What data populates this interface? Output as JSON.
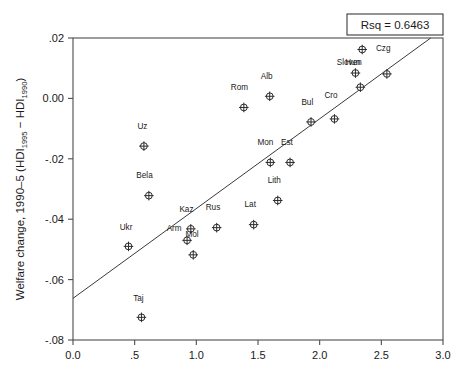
{
  "chart_data": {
    "type": "scatter",
    "title": "",
    "xlabel": "",
    "ylabel": "Welfare change, 1990–5 (HDI1995 − HDI1990)",
    "ylabel_parts": {
      "lead": "Welfare change, 1990–5 (HDI",
      "sub1": "1995",
      "mid": " − HDI",
      "sub2": "1990",
      "tail": ")"
    },
    "xlim": [
      0.0,
      3.0
    ],
    "ylim": [
      -0.08,
      0.02
    ],
    "grid": false,
    "legend": null,
    "xticks": [
      0.0,
      0.5,
      1.0,
      1.5,
      2.0,
      2.5,
      3.0
    ],
    "xtick_labels": [
      "0.0",
      ".5",
      "1.0",
      "1.5",
      "2.0",
      "2.5",
      "3.0"
    ],
    "yticks": [
      0.02,
      0.0,
      -0.02,
      -0.04,
      -0.06,
      -0.08
    ],
    "ytick_labels": [
      ".02",
      "0.00",
      "-.02",
      "-.04",
      "-.06",
      "-.08"
    ],
    "marker_style": "circle-with-cross",
    "points": [
      {
        "label": "Ukr",
        "x": 0.45,
        "y": -0.049,
        "lx": -0.02,
        "ly": 0.0055
      },
      {
        "label": "Taj",
        "x": 0.555,
        "y": -0.0725,
        "lx": -0.025,
        "ly": 0.0055
      },
      {
        "label": "Uz",
        "x": 0.575,
        "y": -0.0158,
        "lx": -0.012,
        "ly": 0.0057
      },
      {
        "label": "Bela",
        "x": 0.615,
        "y": -0.0322,
        "lx": -0.035,
        "ly": 0.0057
      },
      {
        "label": "Arm",
        "x": 0.925,
        "y": -0.047,
        "lx": -0.105,
        "ly": 0.003
      },
      {
        "label": "Kaz",
        "x": 0.955,
        "y": -0.0432,
        "lx": -0.035,
        "ly": 0.0057
      },
      {
        "label": "Mol",
        "x": 0.975,
        "y": -0.0518,
        "lx": -0.01,
        "ly": 0.0058
      },
      {
        "label": "Rus",
        "x": 1.165,
        "y": -0.0428,
        "lx": -0.03,
        "ly": 0.0057
      },
      {
        "label": "Rom",
        "x": 1.385,
        "y": -0.003,
        "lx": -0.035,
        "ly": 0.0057
      },
      {
        "label": "Lat",
        "x": 1.465,
        "y": -0.0418,
        "lx": -0.028,
        "ly": 0.0057
      },
      {
        "label": "Alb",
        "x": 1.595,
        "y": 0.0007,
        "lx": -0.025,
        "ly": 0.0057
      },
      {
        "label": "Mon",
        "x": 1.6,
        "y": -0.0212,
        "lx": -0.04,
        "ly": 0.0057
      },
      {
        "label": "Lith",
        "x": 1.66,
        "y": -0.0338,
        "lx": -0.028,
        "ly": 0.0057
      },
      {
        "label": "Est",
        "x": 1.76,
        "y": -0.0212,
        "lx": -0.025,
        "ly": 0.0057
      },
      {
        "label": "Bul",
        "x": 1.93,
        "y": -0.0078,
        "lx": -0.03,
        "ly": 0.0057
      },
      {
        "label": "Cro",
        "x": 2.12,
        "y": -0.0068,
        "lx": -0.028,
        "ly": 0.007
      },
      {
        "label": "Hun",
        "x": 2.29,
        "y": 0.0084,
        "lx": -0.022,
        "ly": 0.0025
      },
      {
        "label": "Sloven",
        "x": 2.33,
        "y": 0.0037,
        "lx": -0.09,
        "ly": 0.0075
      },
      {
        "label": "Pol",
        "x": 2.345,
        "y": 0.0162,
        "lx": -0.025,
        "ly": 0.0055
      },
      {
        "label": "Czg",
        "x": 2.545,
        "y": 0.0081,
        "lx": -0.03,
        "ly": 0.0075
      }
    ],
    "fit_line": {
      "x_start": 0.0,
      "y_start": -0.0662,
      "x_end": 2.9,
      "y_end": 0.02,
      "slope": 0.02972,
      "intercept": -0.0662
    },
    "annotation": {
      "text": "Rsq = 0.6463",
      "rsq_value": 0.6463
    }
  },
  "colors": {
    "background": "#ffffff",
    "axis": "#4d4d4d",
    "text": "#1a1a1a",
    "marker": "#2b2b2b",
    "fit_line": "#3a3a3a"
  }
}
